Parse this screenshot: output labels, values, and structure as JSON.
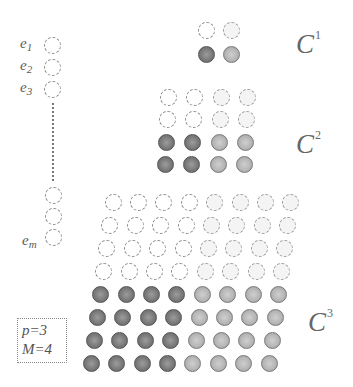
{
  "diagram": {
    "left_column": {
      "labels": {
        "e1": {
          "base": "e",
          "sub": "1"
        },
        "e2": {
          "base": "e",
          "sub": "2"
        },
        "e3": {
          "base": "e",
          "sub": "3"
        },
        "em": {
          "base": "e",
          "sub": "m"
        }
      },
      "top_circles": [
        {
          "x": 52,
          "y": 45,
          "style": "open"
        },
        {
          "x": 52,
          "y": 67,
          "style": "open"
        },
        {
          "x": 52,
          "y": 89,
          "style": "open"
        }
      ],
      "bottom_circles": [
        {
          "x": 53,
          "y": 195,
          "style": "open"
        },
        {
          "x": 53,
          "y": 216,
          "style": "open"
        },
        {
          "x": 53,
          "y": 237,
          "style": "open"
        }
      ],
      "ellipsis": "vertical-dotted-line"
    },
    "groups": [
      {
        "id": "C1",
        "label": {
          "base": "C",
          "sup": "1"
        },
        "rows": 2,
        "cols": 2,
        "origin": {
          "x": 206,
          "y": 30
        },
        "dx": 25,
        "dy": 24,
        "skew": 0,
        "open_rows": 1,
        "dark_cols": 1
      },
      {
        "id": "C2",
        "label": {
          "base": "C",
          "sup": "2"
        },
        "rows": 4,
        "cols": 4,
        "origin": {
          "x": 168,
          "y": 97
        },
        "dx": 26.5,
        "dy": 22.5,
        "skew": -1,
        "open_rows": 2,
        "dark_cols": 2
      },
      {
        "id": "C3",
        "label": {
          "base": "C",
          "sup": "3"
        },
        "rows": 8,
        "cols": 8,
        "origin": {
          "x": 113,
          "y": 202
        },
        "dx": 25.4,
        "dy": 23.1,
        "skew": -3.1,
        "open_rows": 4,
        "dark_cols": 4
      }
    ],
    "params": {
      "p": "p=3",
      "M": "M=4"
    }
  }
}
